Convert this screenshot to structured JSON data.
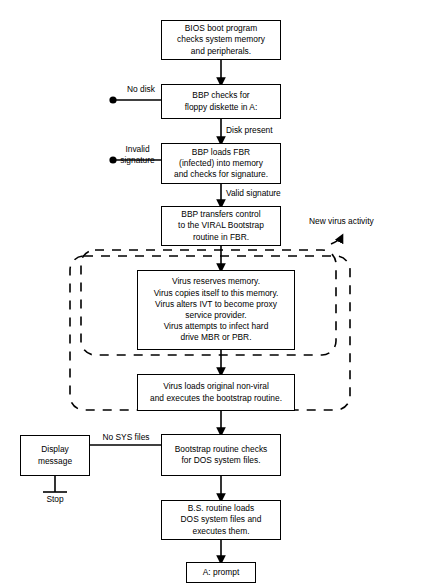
{
  "diagram": {
    "stroke_color": "#000000",
    "background_color": "#ffffff",
    "nodes": [
      {
        "id": "bios",
        "label": "BIOS boot program\nchecks system memory\nand peripherals."
      },
      {
        "id": "bbp_checks_floppy",
        "label": "BBP checks for\nfloppy diskette in A:"
      },
      {
        "id": "bbp_loads_fbr",
        "label": "BBP loads FBR\n(infected) into memory\nand checks for signature."
      },
      {
        "id": "bbp_transfers",
        "label": "BBP transfers control\nto the VIRAL Bootstrap\nroutine in FBR."
      },
      {
        "id": "virus_reserves",
        "label": "Virus reserves memory.\nVirus copies itself to this memory.\nVirus alters IVT to become proxy\nservice provider.\nVirus attempts to infect hard\ndrive MBR or PBR."
      },
      {
        "id": "virus_loads_original",
        "label": "Virus loads original non-viral\nand executes the bootstrap routine."
      },
      {
        "id": "bootstrap_checks",
        "label": "Bootstrap routine checks\nfor DOS system files."
      },
      {
        "id": "display_message",
        "label": "Display\nmessage"
      },
      {
        "id": "bs_routine_loads",
        "label": "B.S. routine loads\nDOS system files and\nexecutes them."
      },
      {
        "id": "a_prompt",
        "label": "A:  prompt"
      }
    ],
    "edge_labels": [
      {
        "id": "no-disk",
        "text": "No disk"
      },
      {
        "id": "disk-present",
        "text": "Disk present"
      },
      {
        "id": "invalid-signature",
        "text": "Invalid\nsignature"
      },
      {
        "id": "valid-signature",
        "text": "Valid signature"
      },
      {
        "id": "new-virus-activity",
        "text": "New virus activity"
      },
      {
        "id": "no-sys-files",
        "text": "No SYS files"
      },
      {
        "id": "stop",
        "text": "Stop"
      }
    ]
  }
}
